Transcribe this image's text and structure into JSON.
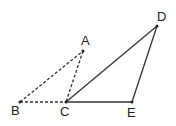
{
  "diagram": {
    "type": "geometry",
    "points": {
      "A": {
        "label": "A",
        "x": 83,
        "y": 51,
        "lx": 81,
        "ly": 45
      },
      "B": {
        "label": "B",
        "x": 20,
        "y": 102,
        "lx": 11,
        "ly": 115
      },
      "C": {
        "label": "C",
        "x": 66,
        "y": 102,
        "lx": 60,
        "ly": 116
      },
      "D": {
        "label": "D",
        "x": 157,
        "y": 26,
        "lx": 157,
        "ly": 21
      },
      "E": {
        "label": "E",
        "x": 132,
        "y": 102,
        "lx": 127,
        "ly": 117
      }
    },
    "segments": [
      {
        "from": "B",
        "to": "A",
        "style": "dashed"
      },
      {
        "from": "A",
        "to": "C",
        "style": "dashed"
      },
      {
        "from": "B",
        "to": "C",
        "style": "dashed"
      },
      {
        "from": "C",
        "to": "D",
        "style": "solid"
      },
      {
        "from": "D",
        "to": "E",
        "style": "solid"
      },
      {
        "from": "C",
        "to": "E",
        "style": "solid"
      }
    ],
    "triangles": [
      {
        "name": "ABC",
        "style": "dashed"
      },
      {
        "name": "CDE",
        "style": "solid"
      }
    ],
    "colors": {
      "line": "#333333",
      "text": "#222222",
      "background": "#ffffff"
    }
  }
}
